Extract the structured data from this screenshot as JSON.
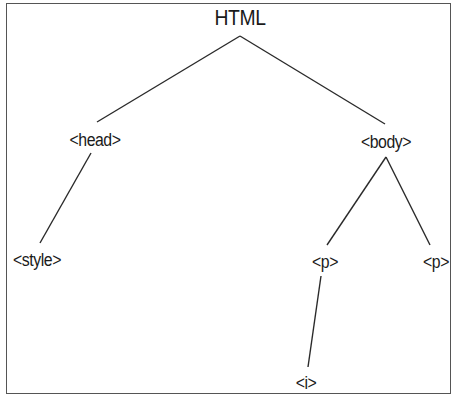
{
  "diagram": {
    "type": "tree",
    "nodes": [
      {
        "id": "html",
        "label": "HTML",
        "x": 240,
        "y": 18
      },
      {
        "id": "head",
        "label": "<head>",
        "x": 95,
        "y": 140
      },
      {
        "id": "body",
        "label": "<body>",
        "x": 386,
        "y": 142
      },
      {
        "id": "style",
        "label": "<style>",
        "x": 37,
        "y": 260
      },
      {
        "id": "p1",
        "label": "<p>",
        "x": 325,
        "y": 262
      },
      {
        "id": "p2",
        "label": "<p>",
        "x": 436,
        "y": 262
      },
      {
        "id": "i",
        "label": "<i>",
        "x": 306,
        "y": 383
      }
    ],
    "edges": [
      {
        "from": "html",
        "to": "head"
      },
      {
        "from": "html",
        "to": "body"
      },
      {
        "from": "head",
        "to": "style"
      },
      {
        "from": "body",
        "to": "p1"
      },
      {
        "from": "body",
        "to": "p2"
      },
      {
        "from": "p1",
        "to": "i"
      }
    ],
    "colors": {
      "line": "#2a2a2a",
      "text": "#1a1a1a",
      "border": "#555555"
    }
  }
}
